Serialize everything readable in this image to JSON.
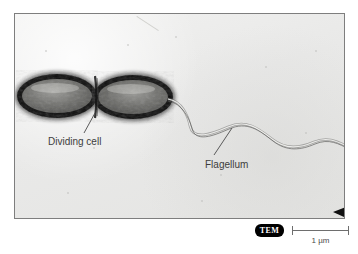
{
  "figure": {
    "kind": "tem-micrograph"
  },
  "micrograph": {
    "background_color": "#ececeb",
    "border_color": "#7e7e7e",
    "corner_marker": "arrowhead-left"
  },
  "annotations": [
    {
      "id": "dividing-cell",
      "label": "Dividing cell",
      "leader_from": {
        "x": 95,
        "y": 113
      },
      "leader_to": {
        "x": 84,
        "y": 133
      },
      "text_x": 48,
      "text_y": 145
    },
    {
      "id": "flagellum",
      "label": "Flagellum",
      "leader_from": {
        "x": 232,
        "y": 128
      },
      "leader_to": {
        "x": 214,
        "y": 155
      },
      "text_x": 205,
      "text_y": 168
    }
  ],
  "caption": {
    "technique_badge": "TEM",
    "scale_label": "1 µm"
  },
  "specimen": {
    "cell": {
      "shape": "rod-shaped dividing bacterium",
      "outline_color": "#111111",
      "interior_color": "#6f6f6d",
      "left_lobe": {
        "cx": 57,
        "cy": 96,
        "rx": 40,
        "ry": 22
      },
      "right_lobe": {
        "cx": 133,
        "cy": 97,
        "rx": 40,
        "ry": 22
      }
    },
    "flagellum": {
      "color": "#7c7c7a",
      "origin": {
        "x": 170,
        "y": 100
      },
      "terminus": {
        "x": 345,
        "y": 146
      },
      "wave_count": 3
    }
  }
}
